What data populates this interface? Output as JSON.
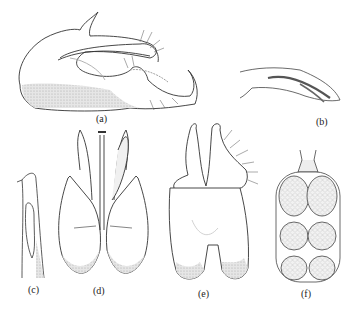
{
  "figure": {
    "panels": [
      {
        "id": "a",
        "label": "(a)",
        "description": "lateral view of genitalia"
      },
      {
        "id": "b",
        "label": "(b)",
        "description": "aedeagus lateral"
      },
      {
        "id": "c",
        "label": "(c)",
        "description": "paramere"
      },
      {
        "id": "d",
        "label": "(d)",
        "description": "ventral view"
      },
      {
        "id": "e",
        "label": "(e)",
        "description": "dorsal view"
      },
      {
        "id": "f",
        "label": "(f)",
        "description": "egg/chamber cluster"
      }
    ]
  },
  "colors": {
    "line": "#333333",
    "stipple": "#c8c8c8",
    "background": "#ffffff"
  }
}
